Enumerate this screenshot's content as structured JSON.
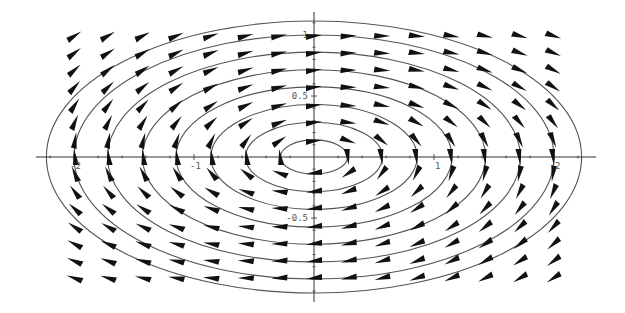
{
  "chart_data": {
    "type": "vector-field",
    "title": "",
    "xlabel": "",
    "ylabel": "",
    "xlim": [
      -2.3,
      2.3
    ],
    "ylim": [
      -1.2,
      1.2
    ],
    "grid": false,
    "legend": null,
    "field": {
      "u": "4*y",
      "v": "-x",
      "direction": "clockwise",
      "arrows_normalized": true
    },
    "arrow_grid": {
      "x": [
        -2.0,
        -1.72,
        -1.43,
        -1.15,
        -0.86,
        -0.57,
        -0.29,
        0.0,
        0.29,
        0.57,
        0.86,
        1.15,
        1.43,
        1.72,
        2.0
      ],
      "y": [
        1.0,
        0.86,
        0.72,
        0.58,
        0.43,
        0.29,
        0.14,
        0.0,
        -0.14,
        -0.29,
        -0.43,
        -0.58,
        -0.72,
        -0.86,
        -1.0
      ]
    },
    "level_curves": {
      "equation": "x^2 + 4*y^2 = c",
      "semi_axes_x": [
        0.28,
        0.57,
        0.86,
        1.15,
        1.43,
        1.72,
        2.0,
        2.23
      ]
    },
    "x_ticks": [
      {
        "value": -2,
        "label": "-2"
      },
      {
        "value": -1,
        "label": "-1"
      },
      {
        "value": 1,
        "label": "1"
      },
      {
        "value": 2,
        "label": "2"
      }
    ],
    "y_ticks": [
      {
        "value": 1,
        "label": "1"
      },
      {
        "value": 0.5,
        "label": "0.5"
      },
      {
        "value": -0.5,
        "label": "-0.5"
      }
    ]
  },
  "colors": {
    "axis": "#333333",
    "curve": "#555555",
    "arrow": "#111111",
    "label": "#555555"
  }
}
